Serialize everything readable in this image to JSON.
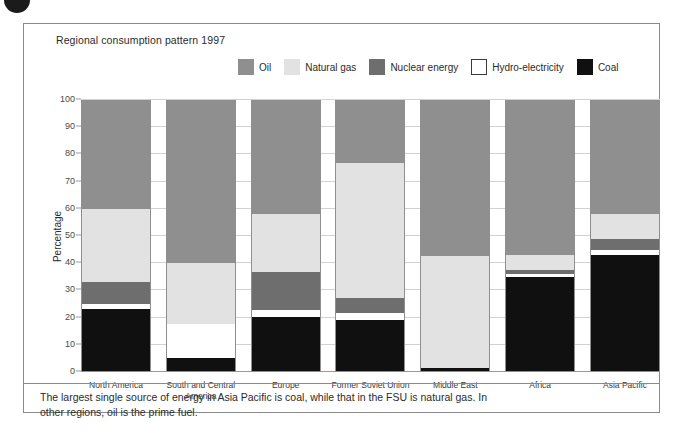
{
  "chart_title": "Regional consumption pattern 1997",
  "caption": "The largest single source of energy in Asia Pacific is coal, while that in the FSU is natural gas. In other regions, oil is the prime fuel.",
  "legend": {
    "items": [
      {
        "label": "Oil",
        "color": "#8f8f8f",
        "outlined": false
      },
      {
        "label": "Natural gas",
        "color": "#e2e2e2",
        "outlined": false
      },
      {
        "label": "Nuclear energy",
        "color": "#6e6e6e",
        "outlined": false
      },
      {
        "label": "Hydro-electricity",
        "color": "#ffffff",
        "outlined": true
      },
      {
        "label": "Coal",
        "color": "#101010",
        "outlined": false
      }
    ]
  },
  "chart_data": {
    "type": "bar",
    "stacked": true,
    "title": "Regional consumption pattern 1997",
    "xlabel": "",
    "ylabel": "Percentage",
    "ylim": [
      0,
      100
    ],
    "yticks": [
      0,
      10,
      20,
      30,
      40,
      50,
      60,
      70,
      80,
      90,
      100
    ],
    "ytick_labels": [
      "0",
      "10",
      "20",
      "30",
      "40",
      "50",
      "60",
      "70",
      "80",
      "90",
      "100"
    ],
    "grid": true,
    "legend_position": "top",
    "categories": [
      "North America",
      "South and Central America",
      "Europe",
      "Former Soviet Union",
      "Middle East",
      "Africa",
      "Asia Pacific"
    ],
    "stack_order_bottom_to_top": [
      "Coal",
      "Hydro-electricity",
      "Nuclear energy",
      "Natural gas",
      "Oil"
    ],
    "series": [
      {
        "name": "Coal",
        "color": "#101010",
        "values": [
          23,
          5,
          20,
          19,
          1,
          35,
          43
        ]
      },
      {
        "name": "Hydro-electricity",
        "color": "#ffffff",
        "values": [
          2,
          12.5,
          2.5,
          2.5,
          0,
          1,
          2
        ]
      },
      {
        "name": "Nuclear energy",
        "color": "#6e6e6e",
        "values": [
          8,
          0,
          14,
          5.5,
          0,
          1.5,
          4
        ]
      },
      {
        "name": "Natural gas",
        "color": "#e2e2e2",
        "values": [
          27,
          22.5,
          21.5,
          50,
          41.5,
          5.5,
          9
        ]
      },
      {
        "name": "Oil",
        "color": "#8f8f8f",
        "values": [
          40,
          60,
          42,
          23,
          57.5,
          57,
          42
        ]
      }
    ]
  }
}
